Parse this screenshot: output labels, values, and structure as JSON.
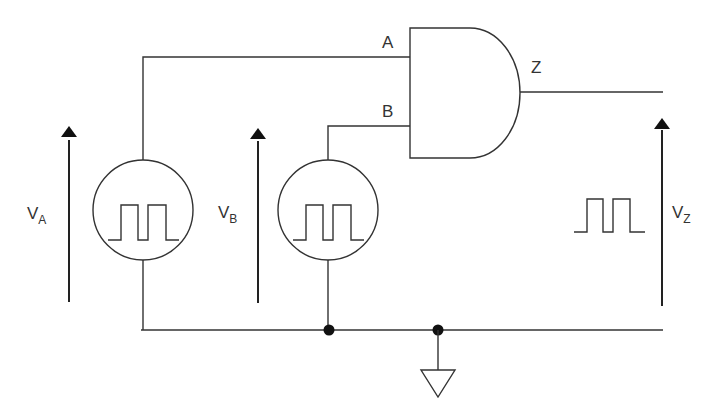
{
  "diagram": {
    "type": "logic-circuit",
    "gate": {
      "type": "AND",
      "inputs": [
        "A",
        "B"
      ],
      "output": "Z"
    },
    "labels": {
      "input_a": "A",
      "input_b": "B",
      "output_z": "Z",
      "va_main": "V",
      "va_sub": "A",
      "vb_main": "V",
      "vb_sub": "B",
      "vz_main": "V",
      "vz_sub": "Z"
    },
    "sources": [
      {
        "name": "source-A",
        "waveform": "square-pulse-train",
        "pulses": 2
      },
      {
        "name": "source-B",
        "waveform": "square-pulse-train",
        "pulses": 2
      }
    ],
    "output_waveform": {
      "waveform": "square-pulse-train",
      "pulses": 2
    },
    "ground": true,
    "junctions": 2,
    "colors": {
      "line": "#333333",
      "background": "#ffffff"
    }
  }
}
